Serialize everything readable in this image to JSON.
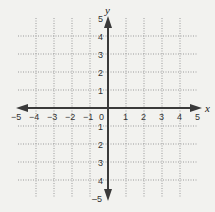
{
  "diagram": {
    "type": "coordinate-plane",
    "x_axis": {
      "label": "x",
      "min": -5,
      "max": 5,
      "tick_labels": [
        "−5",
        "−4",
        "−3",
        "−2",
        "−1",
        "0",
        "1",
        "2",
        "3",
        "4",
        "5"
      ]
    },
    "y_axis": {
      "label": "y",
      "min": -5,
      "max": 5,
      "tick_labels_positive": [
        "1",
        "2",
        "3",
        "4",
        "5"
      ],
      "tick_labels_negative": [
        "1",
        "2",
        "3",
        "4",
        "–5"
      ]
    },
    "origin_label": "0",
    "grid": {
      "style": "dotted",
      "from": -4,
      "to": 4
    },
    "colors": {
      "background": "#f2f2ef",
      "axis": "#3a3a3a",
      "grid": "#9a9a9a",
      "text": "#333333"
    }
  }
}
